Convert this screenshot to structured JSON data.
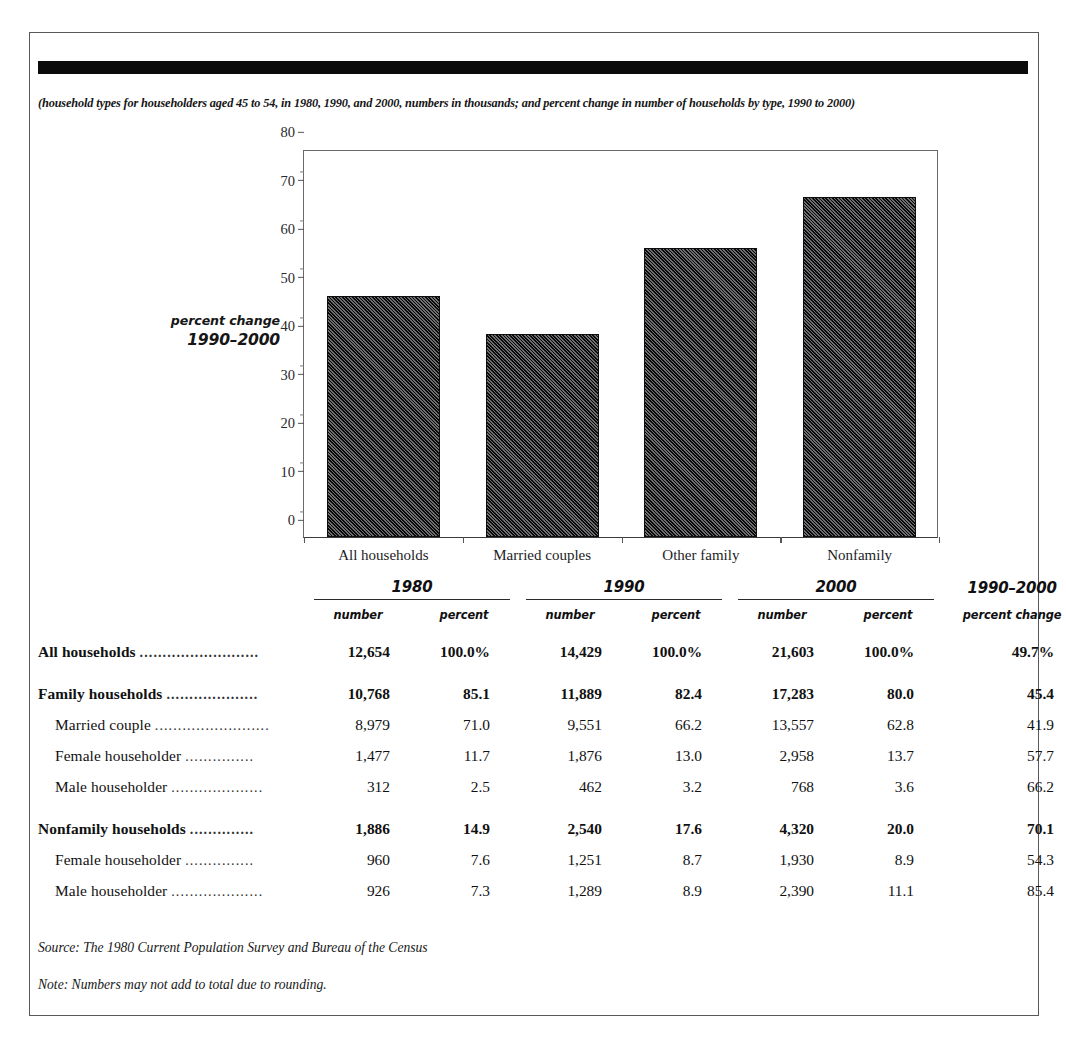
{
  "subtitle": "(household types for householders aged 45 to 54, in 1980, 1990, and 2000, numbers in thousands; and percent change in number of households by type, 1990 to 2000)",
  "axis_note": {
    "line1": "percent change",
    "line2": "1990–2000"
  },
  "chart_data": {
    "type": "bar",
    "title": "",
    "subtitle": "",
    "xlabel": "",
    "ylabel": "percent change 1990–2000",
    "categories": [
      "All households",
      "Married couples",
      "Other family",
      "Nonfamily"
    ],
    "values": [
      49.7,
      41.9,
      59.5,
      70.1
    ],
    "ylim": [
      0,
      80
    ],
    "yticks": [
      0,
      10,
      20,
      30,
      40,
      50,
      60,
      70,
      80
    ],
    "yticklabels": [
      "0",
      "10",
      "20",
      "30",
      "40",
      "50",
      "60",
      "70",
      "80"
    ],
    "minor_tick_step": 5,
    "grid": false,
    "legend": "none",
    "bar_fill": "diagonal-hatch-dark",
    "bar_color": "#2a2a2c"
  },
  "table": {
    "year_headers": [
      {
        "label": "1980",
        "rule": true
      },
      {
        "label": "1990",
        "rule": true
      },
      {
        "label": "2000",
        "rule": true
      },
      {
        "label": "1990–2000",
        "rule": false
      }
    ],
    "sub_headers": [
      "number",
      "percent",
      "number",
      "percent",
      "number",
      "percent",
      "percent change"
    ],
    "dots": "...........................",
    "rows": [
      {
        "label": "All households",
        "bold": true,
        "indent": false,
        "gap_before": false,
        "dots": "..........................",
        "cells": [
          "12,654",
          "100.0%",
          "14,429",
          "100.0%",
          "21,603",
          "100.0%",
          "49.7%"
        ]
      },
      {
        "label": "Family households",
        "bold": true,
        "indent": false,
        "gap_before": true,
        "dots": "....................",
        "cells": [
          "10,768",
          "85.1",
          "11,889",
          "82.4",
          "17,283",
          "80.0",
          "45.4"
        ]
      },
      {
        "label": "Married couple",
        "bold": false,
        "indent": true,
        "gap_before": false,
        "dots": ".........................",
        "cells": [
          "8,979",
          "71.0",
          "9,551",
          "66.2",
          "13,557",
          "62.8",
          "41.9"
        ]
      },
      {
        "label": "Female householder",
        "bold": false,
        "indent": true,
        "gap_before": false,
        "dots": "...............",
        "cells": [
          "1,477",
          "11.7",
          "1,876",
          "13.0",
          "2,958",
          "13.7",
          "57.7"
        ]
      },
      {
        "label": "Male householder",
        "bold": false,
        "indent": true,
        "gap_before": false,
        "dots": "....................",
        "cells": [
          "312",
          "2.5",
          "462",
          "3.2",
          "768",
          "3.6",
          "66.2"
        ]
      },
      {
        "label": "Nonfamily households",
        "bold": true,
        "indent": false,
        "gap_before": true,
        "dots": "..............",
        "cells": [
          "1,886",
          "14.9",
          "2,540",
          "17.6",
          "4,320",
          "20.0",
          "70.1"
        ]
      },
      {
        "label": "Female householder",
        "bold": false,
        "indent": true,
        "gap_before": false,
        "dots": "...............",
        "cells": [
          "960",
          "7.6",
          "1,251",
          "8.7",
          "1,930",
          "8.9",
          "54.3"
        ]
      },
      {
        "label": "Male householder",
        "bold": false,
        "indent": true,
        "gap_before": false,
        "dots": "....................",
        "cells": [
          "926",
          "7.3",
          "1,289",
          "8.9",
          "2,390",
          "11.1",
          "85.4"
        ]
      }
    ]
  },
  "source": "Source: The 1980 Current Population Survey and Bureau of the Census",
  "note": "Note: Numbers may not add to total due to rounding."
}
